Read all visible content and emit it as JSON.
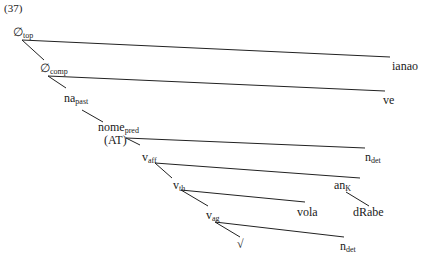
{
  "example_number": "(37)",
  "nodes": {
    "top": {
      "base": "∅",
      "sub": "top"
    },
    "comp": {
      "base": "∅",
      "sub": "comp"
    },
    "na": {
      "base": "na",
      "sub": "past"
    },
    "nome": {
      "base": "nome",
      "sub": "pred"
    },
    "at": {
      "base": "(AT)"
    },
    "vaff": {
      "base": "v",
      "sub": "aff"
    },
    "vth": {
      "base": "v",
      "sub": "th"
    },
    "vag": {
      "base": "v",
      "sub": "ag"
    },
    "root": {
      "base": "√"
    },
    "ianao": {
      "base": "ianao"
    },
    "ve": {
      "base": "ve"
    },
    "ndet1": {
      "base": "n",
      "sub": "det"
    },
    "an": {
      "base": "an",
      "sub": "K"
    },
    "vola": {
      "base": "vola"
    },
    "drabe": {
      "base": "dRabe"
    },
    "ndet2": {
      "base": "n",
      "sub": "det"
    }
  }
}
